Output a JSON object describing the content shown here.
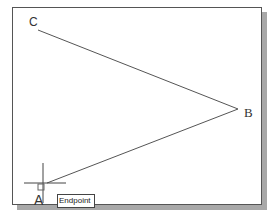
{
  "drawing": {
    "points": [
      {
        "label": "C",
        "x": 38,
        "y": 30
      },
      {
        "label": "B",
        "x": 238,
        "y": 109
      },
      {
        "label": "A",
        "x": 43,
        "y": 184
      }
    ],
    "lines": [
      {
        "from": "C",
        "to": "B"
      },
      {
        "from": "B",
        "to": "A"
      }
    ],
    "line_color": "#555555"
  },
  "cursor": {
    "type": "crosshair",
    "x": 43,
    "y": 184,
    "snap_marker": "endpoint-square"
  },
  "tooltip": {
    "text": "Endpoint"
  },
  "labels": {
    "a": "A",
    "b": "B",
    "c": "C"
  }
}
